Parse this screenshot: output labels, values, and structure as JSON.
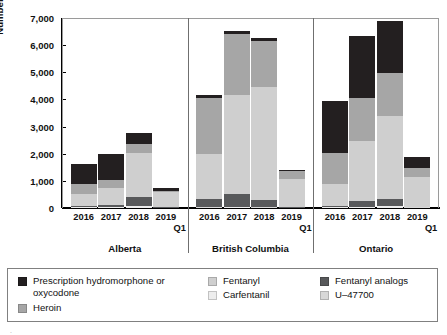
{
  "chart_data": {
    "type": "bar",
    "stacked": true,
    "title": "",
    "xlabel": "",
    "ylabel": "Number of opioids",
    "ylim": [
      0,
      7000
    ],
    "ytick_values": [
      0,
      1000,
      2000,
      3000,
      4000,
      5000,
      6000,
      7000
    ],
    "ytick_labels": [
      "0",
      "1,000",
      "2,000",
      "3,000",
      "4,000",
      "5,000",
      "6,000",
      "7,000"
    ],
    "grid": false,
    "legend_position": "bottom",
    "panels": [
      "Alberta",
      "British Columbia",
      "Ontario"
    ],
    "categories": [
      "2016",
      "2017",
      "2018",
      "2019\nQ1"
    ],
    "series_order": [
      "Carfentanil",
      "U-47700",
      "Fentanyl analogs",
      "Fentanyl",
      "Heroin",
      "Prescription hydromorphone or oxycodone"
    ],
    "series": [
      {
        "name": "Carfentanil",
        "color": "#ededed",
        "values": {
          "Alberta": [
            20,
            25,
            60,
            10
          ],
          "British Columbia": [
            10,
            40,
            15,
            10
          ],
          "Ontario": [
            20,
            40,
            80,
            15
          ]
        }
      },
      {
        "name": "U-47700",
        "color": "#d8d8d8",
        "values": {
          "Alberta": [
            10,
            10,
            10,
            5
          ],
          "British Columbia": [
            10,
            10,
            10,
            5
          ],
          "Ontario": [
            10,
            10,
            10,
            5
          ]
        }
      },
      {
        "name": "Fentanyl analogs",
        "color": "#58595b",
        "values": {
          "Alberta": [
            30,
            60,
            320,
            15
          ],
          "British Columbia": [
            330,
            480,
            280,
            20
          ],
          "Ontario": [
            40,
            200,
            250,
            20
          ]
        }
      },
      {
        "name": "Fentanyl",
        "color": "#cfcfcf",
        "values": {
          "Alberta": [
            440,
            640,
            1640,
            560
          ],
          "British Columbia": [
            1640,
            3620,
            4160,
            1030
          ],
          "Ontario": [
            800,
            2210,
            3040,
            1120
          ]
        }
      },
      {
        "name": "Heroin",
        "color": "#a6a6a6",
        "values": {
          "Alberta": [
            380,
            280,
            330,
            40
          ],
          "British Columbia": [
            2050,
            2260,
            1700,
            310
          ],
          "Ontario": [
            1150,
            1600,
            1600,
            320
          ]
        }
      },
      {
        "name": "Prescription hydromorphone or oxycodone",
        "color": "#231f20",
        "values": {
          "Alberta": [
            730,
            960,
            400,
            100
          ],
          "British Columbia": [
            130,
            130,
            110,
            10
          ],
          "Ontario": [
            1910,
            2290,
            1900,
            410
          ]
        }
      }
    ],
    "panel_totals": {
      "Alberta": [
        1610,
        1975,
        2760,
        730
      ],
      "British Columbia": [
        4170,
        6540,
        6275,
        1385
      ],
      "Ontario": [
        3930,
        6350,
        6880,
        1890
      ]
    }
  },
  "legend": {
    "entries": [
      {
        "label": "Prescription hydromorphone or\noxycodone",
        "color": "#231f20",
        "swatch_name": "legend-swatch-prescription"
      },
      {
        "label": "Heroin",
        "color": "#a6a6a6",
        "swatch_name": "legend-swatch-heroin"
      },
      {
        "label": "Fentanyl",
        "color": "#cfcfcf",
        "swatch_name": "legend-swatch-fentanyl"
      },
      {
        "label": "Carfentanil",
        "color": "#ededed",
        "swatch_name": "legend-swatch-carfentanil"
      },
      {
        "label": "Fentanyl analogs",
        "color": "#58595b",
        "swatch_name": "legend-swatch-fentanyl-analogs"
      },
      {
        "label": "U–47700",
        "color": "#d8d8d8",
        "swatch_name": "legend-swatch-u47700"
      }
    ]
  }
}
